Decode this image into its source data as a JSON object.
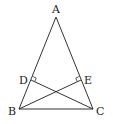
{
  "diagram": {
    "type": "geometry",
    "points": {
      "A": {
        "label": "A",
        "x": 56,
        "y": 17
      },
      "B": {
        "label": "B",
        "x": 19,
        "y": 109
      },
      "C": {
        "label": "C",
        "x": 93,
        "y": 109
      },
      "D": {
        "label": "D",
        "x": 31,
        "y": 80
      },
      "E": {
        "label": "E",
        "x": 81,
        "y": 80
      }
    },
    "segments": [
      "AB",
      "AC",
      "BC",
      "CD",
      "BE"
    ],
    "right_angles": [
      "D",
      "E"
    ],
    "colors": {
      "stroke": "#333333",
      "text": "#222222",
      "background": "#ffffff"
    }
  }
}
